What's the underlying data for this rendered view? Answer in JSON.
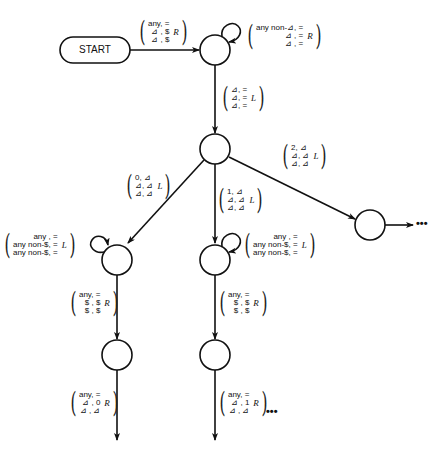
{
  "diagram": {
    "start_label": "START",
    "ellipsis": "•••",
    "edges": {
      "start_to_q1": {
        "rows": [
          "any, =",
          "⊿ , $",
          "⊿ , $"
        ],
        "dir": "R"
      },
      "q1_loop": {
        "rows": [
          "any non-⊿, =",
          "⊿ , =",
          "⊿ , ="
        ],
        "dir": "R"
      },
      "q1_to_q2": {
        "rows": [
          "⊿, =",
          "⊿, =",
          "⊿, ="
        ],
        "dir": "L"
      },
      "q2_to_q3": {
        "rows": [
          "0, ⊿",
          "⊿, ⊿",
          "⊿, ⊿"
        ],
        "dir": "L"
      },
      "q2_to_q4": {
        "rows": [
          "1, ⊿",
          "⊿, ⊿",
          "⊿, ⊿"
        ],
        "dir": "L"
      },
      "q2_to_q5": {
        "rows": [
          "2, ⊿",
          "⊿, ⊿",
          "⊿, ⊿"
        ],
        "dir": "L"
      },
      "q3_loop": {
        "rows": [
          "any , =",
          "any non-$, =",
          "any non-$, ="
        ],
        "dir": "L"
      },
      "q4_loop": {
        "rows": [
          "any , =",
          "any non-$, =",
          "any non-$, ="
        ],
        "dir": "L"
      },
      "q3_to_q6": {
        "rows": [
          "any, =",
          "$ , $",
          "$ , $"
        ],
        "dir": "R"
      },
      "q4_to_q7": {
        "rows": [
          "any, =",
          "$ , $",
          "$ , $"
        ],
        "dir": "R"
      },
      "q6_out": {
        "rows": [
          "any, =",
          "⊿ , 0",
          "⊿ , ⊿"
        ],
        "dir": "R"
      },
      "q7_out": {
        "rows": [
          "any, =",
          "⊿ , 1",
          "⊿ , ⊿"
        ],
        "dir": "R"
      }
    }
  }
}
